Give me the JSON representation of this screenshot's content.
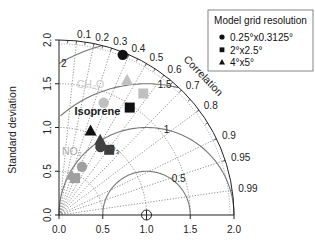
{
  "chart_data": {
    "type": "scatter",
    "subtype": "taylor-diagram",
    "title": "",
    "ylabel": "Standard deviation",
    "xlabel": "",
    "radial_label": "Correlation",
    "std_ticks": [
      "0.0",
      "0.5",
      "1.0",
      "1.5",
      "2.0"
    ],
    "std_values": [
      0.0,
      0.5,
      1.0,
      1.5,
      2.0
    ],
    "correlation_ticks": [
      0.1,
      0.2,
      0.3,
      0.4,
      0.5,
      0.6,
      0.7,
      0.8,
      0.9,
      0.95,
      0.99
    ],
    "correlation_tick_labels": [
      "0.1",
      "0.2",
      "0.3",
      "0.4",
      "0.5",
      "0.6",
      "0.7",
      "0.8",
      "0.9",
      "0.95",
      "0.99"
    ],
    "rms_arcs": [
      0.5,
      1,
      1.5,
      2
    ],
    "rms_arc_labels": [
      "0.5",
      "1",
      "1.5",
      "2"
    ],
    "reference_point": {
      "std": 1.0,
      "corr": 1.0
    },
    "xlim": [
      0,
      2
    ],
    "ylim": [
      0,
      2
    ],
    "legend": {
      "title": "Model grid resolution",
      "position": "top-right",
      "entries": [
        {
          "label": "0.25°x0.3125°",
          "marker": "circle"
        },
        {
          "label": "2°x2.5°",
          "marker": "square"
        },
        {
          "label": "4°x5°",
          "marker": "triangle"
        }
      ]
    },
    "species_labels": [
      {
        "label": "CH₂O",
        "color": "#c8c8c8",
        "std": 1.5,
        "corr": 0.24
      },
      {
        "label": "Isoprene",
        "color": "#1a1a1a",
        "std": 1.22,
        "corr": 0.36
      },
      {
        "label": "O₃",
        "color": "#3a3a3a",
        "std": 0.94,
        "corr": 0.66
      },
      {
        "label": "NO₂",
        "color": "#a8a8a8",
        "std": 0.7,
        "corr": 0.21
      }
    ],
    "series": [
      {
        "name": "CH2O",
        "color": "#c0c0c0",
        "points": [
          {
            "resolution": "0.25°x0.3125°",
            "marker": "circle",
            "std": 1.38,
            "corr": 0.37
          },
          {
            "resolution": "2°x2.5°",
            "marker": "square",
            "std": 1.69,
            "corr": 0.57
          },
          {
            "resolution": "4°x5°",
            "marker": "triangle",
            "std": 1.73,
            "corr": 0.45
          }
        ]
      },
      {
        "name": "Isoprene",
        "color": "#111111",
        "points": [
          {
            "resolution": "0.25°x0.3125°",
            "marker": "circle",
            "std": 1.97,
            "corr": 0.37
          },
          {
            "resolution": "2°x2.5°",
            "marker": "square",
            "std": 1.47,
            "corr": 0.55
          },
          {
            "resolution": "4°x5°",
            "marker": "triangle",
            "std": 1.03,
            "corr": 0.35
          }
        ]
      },
      {
        "name": "O3",
        "color": "#404040",
        "points": [
          {
            "resolution": "0.25°x0.3125°",
            "marker": "circle",
            "std": 0.91,
            "corr": 0.52
          },
          {
            "resolution": "2°x2.5°",
            "marker": "square",
            "std": 0.94,
            "corr": 0.61
          },
          {
            "resolution": "4°x5°",
            "marker": "triangle",
            "std": 0.98,
            "corr": 0.48
          }
        ]
      },
      {
        "name": "NO2",
        "color": "#a0a0a0",
        "points": [
          {
            "resolution": "0.25°x0.3125°",
            "marker": "circle",
            "std": 0.61,
            "corr": 0.43
          },
          {
            "resolution": "2°x2.5°",
            "marker": "square",
            "std": 0.46,
            "corr": 0.4
          },
          {
            "resolution": "4°x5°",
            "marker": "triangle",
            "std": 0.48,
            "corr": 0.29
          }
        ]
      }
    ]
  }
}
